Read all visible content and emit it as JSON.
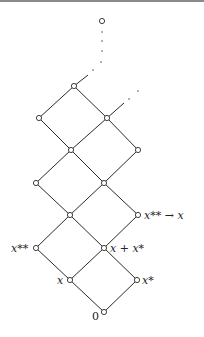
{
  "diagram": {
    "type": "lattice",
    "nodes": [
      {
        "id": "top",
        "x": 102,
        "y": 21
      },
      {
        "id": "n1",
        "x": 74,
        "y": 86
      },
      {
        "id": "n2",
        "x": 39,
        "y": 118
      },
      {
        "id": "n3",
        "x": 107,
        "y": 118
      },
      {
        "id": "n4",
        "x": 71,
        "y": 150
      },
      {
        "id": "n5",
        "x": 138,
        "y": 150
      },
      {
        "id": "n6",
        "x": 36,
        "y": 183
      },
      {
        "id": "n7",
        "x": 104,
        "y": 183
      },
      {
        "id": "n8",
        "x": 70,
        "y": 215
      },
      {
        "id": "n9",
        "x": 138,
        "y": 215
      },
      {
        "id": "n10",
        "x": 36,
        "y": 248
      },
      {
        "id": "n11",
        "x": 104,
        "y": 248
      },
      {
        "id": "n12",
        "x": 70,
        "y": 280
      },
      {
        "id": "n13",
        "x": 137,
        "y": 280
      },
      {
        "id": "zero",
        "x": 104,
        "y": 312
      }
    ],
    "labels": {
      "zero": "0",
      "x": "x",
      "x_star": "x*",
      "x_plus_x_star": "x + x*",
      "x_double_star": "x**",
      "x_double_star_to_x": "x** → x"
    }
  }
}
